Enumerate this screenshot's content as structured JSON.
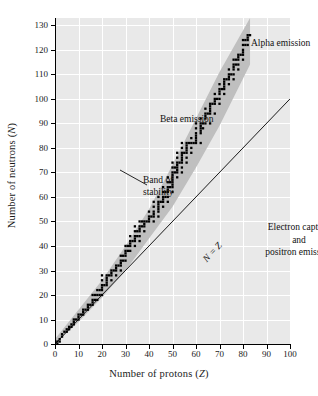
{
  "figure": {
    "background": "#ffffff",
    "plot_background": "#e9e9e9",
    "grid_color": "#ffffff",
    "band_color": "#bfbfbf",
    "point_color": "#000000",
    "line_color": "#1a1a1a"
  },
  "axes": {
    "x_title_pre": "Number of protons (",
    "x_title_sym": "Z",
    "x_title_post": ")",
    "y_title_pre": "Number of neutrons (",
    "y_title_sym": "N",
    "y_title_post": ")",
    "x_ticks": [
      0,
      10,
      20,
      30,
      40,
      50,
      60,
      70,
      80,
      90,
      100
    ],
    "y_ticks": [
      0,
      10,
      20,
      30,
      40,
      50,
      60,
      70,
      80,
      90,
      100,
      110,
      120,
      130
    ]
  },
  "annotations": {
    "alpha": "Alpha emission",
    "beta": "Beta emission",
    "band_line1": "Band of",
    "band_line2": "stability",
    "ec_line1": "Electron capture",
    "ec_line2": "and",
    "ec_line3": "positron emission",
    "nz_line": "N = Z"
  },
  "chart_data": {
    "type": "scatter",
    "title": "",
    "xlabel": "Number of protons (Z)",
    "ylabel": "Number of neutrons (N)",
    "xlim": [
      0,
      100
    ],
    "ylim": [
      0,
      133
    ],
    "xticks": [
      0,
      10,
      20,
      30,
      40,
      50,
      60,
      70,
      80,
      90,
      100
    ],
    "yticks": [
      0,
      10,
      20,
      30,
      40,
      50,
      60,
      70,
      80,
      90,
      100,
      110,
      120,
      130
    ],
    "grid": true,
    "legend": "none",
    "reference_line": {
      "name": "N = Z",
      "type": "line",
      "x": [
        0,
        100
      ],
      "y": [
        0,
        100
      ],
      "label": "N = Z"
    },
    "band": {
      "name": "Band of stability",
      "type": "area",
      "x": [
        0,
        10,
        20,
        30,
        40,
        50,
        60,
        70,
        83
      ],
      "y_lower": [
        0,
        9,
        19,
        30,
        43,
        56,
        72,
        89,
        114
      ],
      "y_upper": [
        2,
        14,
        26,
        40,
        55,
        73,
        92,
        111,
        133
      ]
    },
    "series": [
      {
        "name": "Stable nuclides",
        "type": "scatter",
        "points": [
          [
            1,
            0
          ],
          [
            1,
            1
          ],
          [
            2,
            1
          ],
          [
            2,
            2
          ],
          [
            3,
            3
          ],
          [
            3,
            4
          ],
          [
            4,
            5
          ],
          [
            5,
            5
          ],
          [
            5,
            6
          ],
          [
            6,
            6
          ],
          [
            6,
            7
          ],
          [
            7,
            7
          ],
          [
            7,
            8
          ],
          [
            8,
            8
          ],
          [
            8,
            9
          ],
          [
            8,
            10
          ],
          [
            9,
            10
          ],
          [
            10,
            10
          ],
          [
            10,
            11
          ],
          [
            10,
            12
          ],
          [
            11,
            12
          ],
          [
            12,
            12
          ],
          [
            12,
            13
          ],
          [
            12,
            14
          ],
          [
            13,
            14
          ],
          [
            14,
            14
          ],
          [
            14,
            15
          ],
          [
            14,
            16
          ],
          [
            15,
            16
          ],
          [
            16,
            16
          ],
          [
            16,
            17
          ],
          [
            16,
            18
          ],
          [
            16,
            20
          ],
          [
            17,
            18
          ],
          [
            17,
            20
          ],
          [
            18,
            18
          ],
          [
            18,
            20
          ],
          [
            18,
            22
          ],
          [
            19,
            20
          ],
          [
            19,
            22
          ],
          [
            20,
            20
          ],
          [
            20,
            22
          ],
          [
            20,
            23
          ],
          [
            20,
            24
          ],
          [
            20,
            26
          ],
          [
            20,
            28
          ],
          [
            21,
            24
          ],
          [
            22,
            24
          ],
          [
            22,
            25
          ],
          [
            22,
            26
          ],
          [
            22,
            27
          ],
          [
            22,
            28
          ],
          [
            23,
            28
          ],
          [
            24,
            26
          ],
          [
            24,
            28
          ],
          [
            24,
            29
          ],
          [
            24,
            30
          ],
          [
            25,
            30
          ],
          [
            26,
            28
          ],
          [
            26,
            30
          ],
          [
            26,
            31
          ],
          [
            26,
            32
          ],
          [
            27,
            32
          ],
          [
            28,
            30
          ],
          [
            28,
            32
          ],
          [
            28,
            33
          ],
          [
            28,
            34
          ],
          [
            28,
            36
          ],
          [
            29,
            34
          ],
          [
            29,
            36
          ],
          [
            30,
            34
          ],
          [
            30,
            36
          ],
          [
            30,
            37
          ],
          [
            30,
            38
          ],
          [
            30,
            40
          ],
          [
            31,
            38
          ],
          [
            31,
            40
          ],
          [
            32,
            38
          ],
          [
            32,
            40
          ],
          [
            32,
            41
          ],
          [
            32,
            42
          ],
          [
            32,
            44
          ],
          [
            33,
            42
          ],
          [
            34,
            40
          ],
          [
            34,
            42
          ],
          [
            34,
            43
          ],
          [
            34,
            44
          ],
          [
            34,
            46
          ],
          [
            34,
            48
          ],
          [
            35,
            44
          ],
          [
            35,
            46
          ],
          [
            36,
            42
          ],
          [
            36,
            44
          ],
          [
            36,
            46
          ],
          [
            36,
            47
          ],
          [
            36,
            48
          ],
          [
            36,
            50
          ],
          [
            37,
            48
          ],
          [
            37,
            50
          ],
          [
            38,
            46
          ],
          [
            38,
            48
          ],
          [
            38,
            49
          ],
          [
            38,
            50
          ],
          [
            39,
            50
          ],
          [
            40,
            50
          ],
          [
            40,
            51
          ],
          [
            40,
            52
          ],
          [
            40,
            54
          ],
          [
            41,
            52
          ],
          [
            42,
            50
          ],
          [
            42,
            52
          ],
          [
            42,
            53
          ],
          [
            42,
            54
          ],
          [
            42,
            56
          ],
          [
            42,
            58
          ],
          [
            44,
            52
          ],
          [
            44,
            54
          ],
          [
            44,
            55
          ],
          [
            44,
            56
          ],
          [
            44,
            57
          ],
          [
            44,
            58
          ],
          [
            44,
            60
          ],
          [
            45,
            58
          ],
          [
            46,
            56
          ],
          [
            46,
            58
          ],
          [
            46,
            59
          ],
          [
            46,
            60
          ],
          [
            46,
            62
          ],
          [
            46,
            64
          ],
          [
            47,
            60
          ],
          [
            47,
            62
          ],
          [
            48,
            58
          ],
          [
            48,
            60
          ],
          [
            48,
            62
          ],
          [
            48,
            63
          ],
          [
            48,
            64
          ],
          [
            48,
            66
          ],
          [
            48,
            68
          ],
          [
            49,
            64
          ],
          [
            49,
            66
          ],
          [
            50,
            62
          ],
          [
            50,
            64
          ],
          [
            50,
            65
          ],
          [
            50,
            66
          ],
          [
            50,
            67
          ],
          [
            50,
            68
          ],
          [
            50,
            69
          ],
          [
            50,
            70
          ],
          [
            50,
            72
          ],
          [
            50,
            74
          ],
          [
            51,
            70
          ],
          [
            51,
            72
          ],
          [
            52,
            68
          ],
          [
            52,
            70
          ],
          [
            52,
            71
          ],
          [
            52,
            72
          ],
          [
            52,
            73
          ],
          [
            52,
            74
          ],
          [
            52,
            76
          ],
          [
            52,
            78
          ],
          [
            53,
            74
          ],
          [
            54,
            70
          ],
          [
            54,
            72
          ],
          [
            54,
            74
          ],
          [
            54,
            75
          ],
          [
            54,
            76
          ],
          [
            54,
            77
          ],
          [
            54,
            78
          ],
          [
            54,
            80
          ],
          [
            54,
            82
          ],
          [
            55,
            78
          ],
          [
            56,
            74
          ],
          [
            56,
            76
          ],
          [
            56,
            78
          ],
          [
            56,
            79
          ],
          [
            56,
            80
          ],
          [
            56,
            81
          ],
          [
            56,
            82
          ],
          [
            57,
            82
          ],
          [
            58,
            78
          ],
          [
            58,
            80
          ],
          [
            58,
            82
          ],
          [
            58,
            84
          ],
          [
            59,
            82
          ],
          [
            60,
            82
          ],
          [
            60,
            83
          ],
          [
            60,
            84
          ],
          [
            60,
            85
          ],
          [
            60,
            86
          ],
          [
            60,
            88
          ],
          [
            60,
            90
          ],
          [
            62,
            82
          ],
          [
            62,
            86
          ],
          [
            62,
            87
          ],
          [
            62,
            88
          ],
          [
            62,
            89
          ],
          [
            62,
            90
          ],
          [
            62,
            92
          ],
          [
            63,
            88
          ],
          [
            63,
            90
          ],
          [
            64,
            90
          ],
          [
            64,
            92
          ],
          [
            64,
            93
          ],
          [
            64,
            94
          ],
          [
            64,
            96
          ],
          [
            65,
            94
          ],
          [
            66,
            90
          ],
          [
            66,
            94
          ],
          [
            66,
            95
          ],
          [
            66,
            96
          ],
          [
            66,
            97
          ],
          [
            66,
            98
          ],
          [
            67,
            98
          ],
          [
            68,
            94
          ],
          [
            68,
            98
          ],
          [
            68,
            99
          ],
          [
            68,
            100
          ],
          [
            68,
            102
          ],
          [
            69,
            100
          ],
          [
            70,
            98
          ],
          [
            70,
            100
          ],
          [
            70,
            102
          ],
          [
            70,
            103
          ],
          [
            70,
            104
          ],
          [
            70,
            106
          ],
          [
            71,
            104
          ],
          [
            72,
            102
          ],
          [
            72,
            104
          ],
          [
            72,
            105
          ],
          [
            72,
            106
          ],
          [
            72,
            107
          ],
          [
            72,
            108
          ],
          [
            73,
            108
          ],
          [
            74,
            106
          ],
          [
            74,
            108
          ],
          [
            74,
            109
          ],
          [
            74,
            110
          ],
          [
            74,
            112
          ],
          [
            75,
            110
          ],
          [
            76,
            108
          ],
          [
            76,
            110
          ],
          [
            76,
            112
          ],
          [
            76,
            113
          ],
          [
            76,
            114
          ],
          [
            76,
            116
          ],
          [
            77,
            114
          ],
          [
            77,
            116
          ],
          [
            78,
            112
          ],
          [
            78,
            114
          ],
          [
            78,
            116
          ],
          [
            78,
            117
          ],
          [
            78,
            118
          ],
          [
            79,
            118
          ],
          [
            80,
            116
          ],
          [
            80,
            118
          ],
          [
            80,
            119
          ],
          [
            80,
            120
          ],
          [
            80,
            122
          ],
          [
            80,
            124
          ],
          [
            81,
            122
          ],
          [
            81,
            124
          ],
          [
            82,
            122
          ],
          [
            82,
            124
          ],
          [
            82,
            125
          ],
          [
            82,
            126
          ],
          [
            83,
            126
          ]
        ]
      }
    ]
  }
}
